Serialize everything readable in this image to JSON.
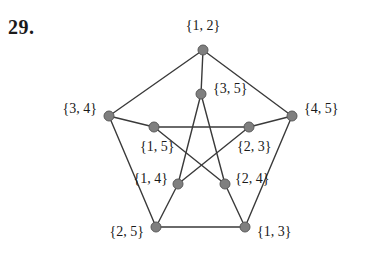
{
  "problem": {
    "number": "29."
  },
  "figure": {
    "name": "petersen-graph",
    "node_color": "#7f7f7f",
    "node_stroke": "#5a5a5a",
    "edge_color": "#3a3a3a",
    "background": "#ffffff",
    "node_radius": 5,
    "edge_width": 1.4
  },
  "graph_data": {
    "type": "graph",
    "title": "",
    "nodes": [
      {
        "id": "12",
        "label": "{1, 2}",
        "x": 203,
        "y": 50,
        "label_x": 203,
        "label_y": 27,
        "label_anchor": "center"
      },
      {
        "id": "34",
        "label": "{3, 4}",
        "x": 109,
        "y": 116,
        "label_x": 97,
        "label_y": 110,
        "label_anchor": "right"
      },
      {
        "id": "45",
        "label": "{4, 5}",
        "x": 292,
        "y": 116,
        "label_x": 304,
        "label_y": 110,
        "label_anchor": "left"
      },
      {
        "id": "25",
        "label": "{2, 5}",
        "x": 156,
        "y": 227,
        "label_x": 144,
        "label_y": 233,
        "label_anchor": "right"
      },
      {
        "id": "13",
        "label": "{1, 3}",
        "x": 245,
        "y": 227,
        "label_x": 257,
        "label_y": 233,
        "label_anchor": "left"
      },
      {
        "id": "35",
        "label": "{3, 5}",
        "x": 201,
        "y": 94,
        "label_x": 213,
        "label_y": 90,
        "label_anchor": "left"
      },
      {
        "id": "15",
        "label": "{1, 5}",
        "x": 154,
        "y": 127,
        "label_x": 140,
        "label_y": 148,
        "label_anchor": "left"
      },
      {
        "id": "23",
        "label": "{2, 3}",
        "x": 249,
        "y": 127,
        "label_x": 237,
        "label_y": 148,
        "label_anchor": "left"
      },
      {
        "id": "14",
        "label": "{1, 4}",
        "x": 178,
        "y": 184,
        "label_x": 168,
        "label_y": 180,
        "label_anchor": "right"
      },
      {
        "id": "24",
        "label": "{2, 4}",
        "x": 225,
        "y": 184,
        "label_x": 235,
        "label_y": 180,
        "label_anchor": "left"
      }
    ],
    "edges": [
      {
        "from": "12",
        "to": "34"
      },
      {
        "from": "12",
        "to": "45"
      },
      {
        "from": "34",
        "to": "25"
      },
      {
        "from": "45",
        "to": "13"
      },
      {
        "from": "25",
        "to": "13"
      },
      {
        "from": "12",
        "to": "35"
      },
      {
        "from": "34",
        "to": "15"
      },
      {
        "from": "45",
        "to": "23"
      },
      {
        "from": "25",
        "to": "14"
      },
      {
        "from": "13",
        "to": "24"
      },
      {
        "from": "35",
        "to": "14"
      },
      {
        "from": "35",
        "to": "24"
      },
      {
        "from": "15",
        "to": "23"
      },
      {
        "from": "15",
        "to": "24"
      },
      {
        "from": "23",
        "to": "14"
      }
    ]
  }
}
